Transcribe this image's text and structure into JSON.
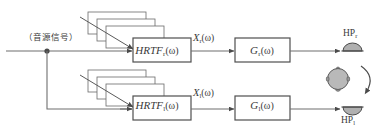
{
  "diagram": {
    "source_label": "（音源信号）",
    "channels": {
      "right": {
        "hrtf_label": "HRTF",
        "hrtf_subscript": "r",
        "hrtf_arg": "(ω)",
        "signal_label": "X",
        "signal_subscript": "r",
        "signal_arg": "(ω)",
        "gain_label": "G",
        "gain_subscript": "r",
        "gain_arg": "(ω)",
        "output_label": "HP",
        "output_subscript": "r"
      },
      "left": {
        "hrtf_label": "HRTF",
        "hrtf_subscript": "l",
        "hrtf_arg": "(ω)",
        "signal_label": "X",
        "signal_subscript": "l",
        "signal_arg": "(ω)",
        "gain_label": "G",
        "gain_subscript": "l",
        "gain_arg": "(ω)",
        "output_label": "HP",
        "output_subscript": "l"
      }
    },
    "icons": {
      "head": "head-top-view-icon",
      "rotation": "head-rotation-arrow-icon",
      "earpiece_right": "headphone-earpiece-icon",
      "earpiece_left": "headphone-earpiece-icon",
      "hrtf_stack": "hrtf-database-stack-icon",
      "junction": "signal-junction-dot"
    },
    "colors": {
      "line": "#6f6f6f",
      "box_stroke": "#5a5a5a",
      "text": "#3a3a3a",
      "fill_gray": "#b9b9b9",
      "background": "#ffffff"
    },
    "stack_depth": 3
  }
}
